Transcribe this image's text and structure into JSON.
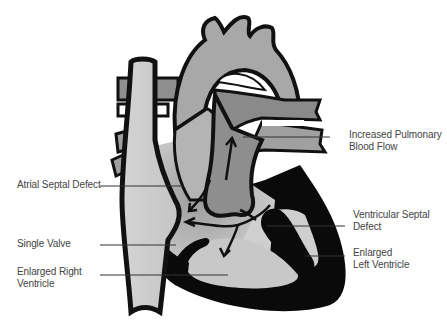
{
  "diagram": {
    "type": "anatomical-illustration",
    "colors": {
      "outline": "#111111",
      "chamber_light": "#cfcfcf",
      "vessel_mid": "#a8a8a8",
      "pulmonary_dark": "#8a8a8a",
      "muscle": "#0a0a0a",
      "shadow": "#b0b0b0",
      "leader_line": "#333333",
      "label_text": "#444444",
      "background": "#ffffff"
    },
    "labels": [
      {
        "id": "increased-pulmonary-blood-flow",
        "lines": [
          "Increased Pulmonary",
          "Blood Flow"
        ],
        "side": "right"
      },
      {
        "id": "atrial-septal-defect",
        "lines": [
          "Atrial Septal Defect"
        ],
        "side": "left"
      },
      {
        "id": "ventricular-septal-defect",
        "lines": [
          "Ventricular Septal",
          "Defect"
        ],
        "side": "right"
      },
      {
        "id": "single-valve",
        "lines": [
          "Single Valve"
        ],
        "side": "left"
      },
      {
        "id": "enlarged-left-ventricle",
        "lines": [
          "Enlarged",
          "Left Ventricle"
        ],
        "side": "right"
      },
      {
        "id": "enlarged-right-ventricle",
        "lines": [
          "Enlarged Right",
          "Ventricle"
        ],
        "side": "left"
      }
    ]
  }
}
